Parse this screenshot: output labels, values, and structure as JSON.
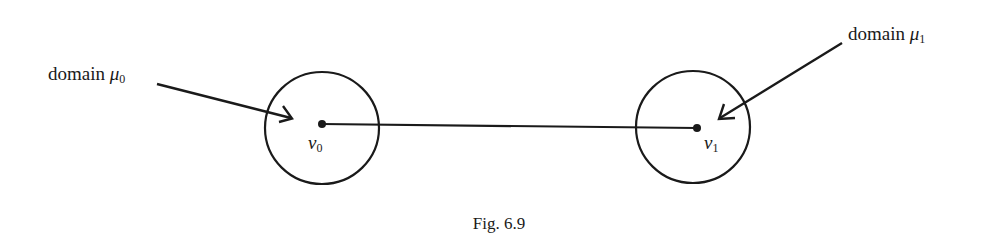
{
  "figure": {
    "caption": "Fig. 6.9",
    "stroke_color": "#1a1a1a",
    "domains": [
      {
        "id": "mu0",
        "label_text": "domain",
        "symbol": "μ",
        "subscript": "0",
        "vertex_symbol": "v",
        "vertex_subscript": "0"
      },
      {
        "id": "mu1",
        "label_text": "domain",
        "symbol": "μ",
        "subscript": "1",
        "vertex_symbol": "v",
        "vertex_subscript": "1"
      }
    ]
  }
}
